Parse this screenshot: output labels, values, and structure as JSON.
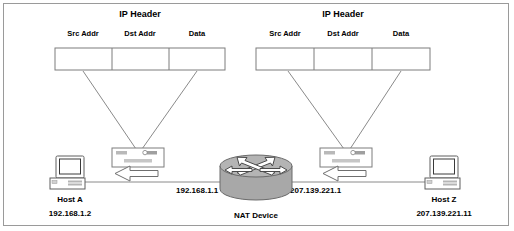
{
  "figure": {
    "background": "#ffffff",
    "border_color": "#9a9a9a",
    "line_color": "#8a8a8a",
    "text_color": "#000000",
    "device_fill": "#a8a8a8"
  },
  "packets": [
    {
      "id": "left-packet",
      "header_title": "IP Header",
      "columns": [
        {
          "label": "Src Addr",
          "value": "192.168.1.2"
        },
        {
          "label": "Dst Addr",
          "value": "192.168.1.1"
        },
        {
          "label": "Data",
          "value": ""
        }
      ]
    },
    {
      "id": "right-packet",
      "header_title": "IP Header",
      "columns": [
        {
          "label": "Src Addr",
          "value": "207.139.221.11"
        },
        {
          "label": "Dst Addr",
          "value": "207.139.221.2"
        },
        {
          "label": "Data",
          "value": ""
        }
      ]
    }
  ],
  "network": {
    "hosts": [
      {
        "id": "host-a",
        "name": "Host A",
        "address": "192.168.1.2"
      },
      {
        "id": "host-z",
        "name": "Host Z",
        "address": "207.139.221.11"
      }
    ],
    "device": {
      "id": "nat-device",
      "label": "NAT Device",
      "icon": "router-icon"
    },
    "interfaces": [
      {
        "id": "inside-interface",
        "address": "192.168.1.1"
      },
      {
        "id": "outside-interface",
        "address": "207.139.221.1"
      }
    ],
    "flow_arrows": [
      {
        "id": "left-flow-arrow",
        "direction": "left"
      },
      {
        "id": "right-flow-arrow",
        "direction": "left"
      }
    ]
  }
}
